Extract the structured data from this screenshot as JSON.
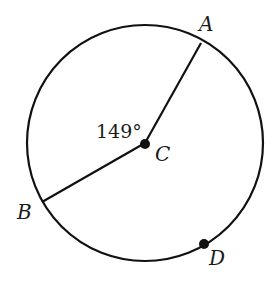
{
  "diagram": {
    "type": "circle-with-radii",
    "center": {
      "label": "C",
      "x": 145,
      "y": 143
    },
    "radius": 118,
    "points": [
      {
        "label": "A",
        "x": 201,
        "y": 43,
        "on_circle": true,
        "marked": false
      },
      {
        "label": "B",
        "x": 42,
        "y": 202,
        "on_circle": true,
        "marked": false
      },
      {
        "label": "D",
        "x": 204,
        "y": 244,
        "on_circle": true,
        "marked": true
      }
    ],
    "segments": [
      {
        "from": "C",
        "to": "A"
      },
      {
        "from": "C",
        "to": "B"
      }
    ],
    "angle": {
      "vertex": "C",
      "between": [
        "A",
        "B"
      ],
      "label": "149°"
    }
  },
  "labels": {
    "angle": "149°",
    "A": "A",
    "B": "B",
    "C": "C",
    "D": "D"
  },
  "colors": {
    "stroke": "#111111",
    "background": "#ffffff"
  }
}
